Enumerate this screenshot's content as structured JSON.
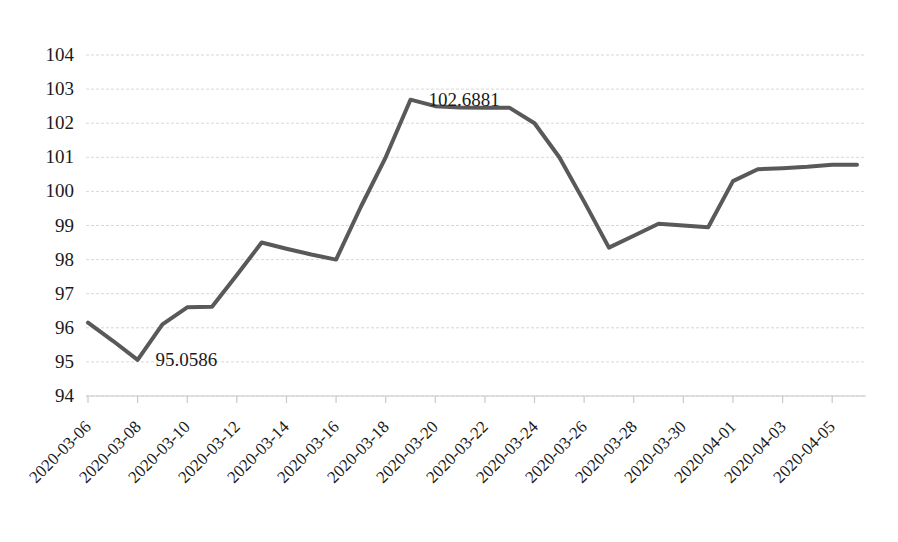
{
  "chart_data": {
    "type": "line",
    "title": "",
    "xlabel": "",
    "ylabel": "",
    "ylim": [
      94,
      104
    ],
    "ytick_step": 1,
    "grid": true,
    "grid_axis": "y",
    "legend": "none",
    "line_color": "#595959",
    "line_width": 4,
    "x": [
      "2020-03-06",
      "2020-03-07",
      "2020-03-08",
      "2020-03-09",
      "2020-03-10",
      "2020-03-11",
      "2020-03-12",
      "2020-03-13",
      "2020-03-14",
      "2020-03-15",
      "2020-03-16",
      "2020-03-17",
      "2020-03-18",
      "2020-03-19",
      "2020-03-20",
      "2020-03-21",
      "2020-03-22",
      "2020-03-23",
      "2020-03-24",
      "2020-03-25",
      "2020-03-26",
      "2020-03-27",
      "2020-03-28",
      "2020-03-29",
      "2020-03-30",
      "2020-03-31",
      "2020-04-01",
      "2020-04-02",
      "2020-04-03",
      "2020-04-04",
      "2020-04-05",
      "2020-04-06"
    ],
    "values": [
      96.15,
      95.62,
      95.06,
      96.1,
      96.6,
      96.62,
      97.55,
      98.5,
      98.32,
      98.15,
      98.0,
      99.55,
      101.0,
      102.69,
      102.5,
      102.46,
      102.45,
      102.45,
      102.0,
      101.0,
      99.7,
      98.35,
      98.7,
      99.05,
      99.0,
      98.95,
      100.3,
      100.65,
      100.68,
      100.72,
      100.78,
      100.78
    ],
    "ytick_labels": [
      "104",
      "103",
      "102",
      "101",
      "100",
      "99",
      "98",
      "97",
      "96",
      "95",
      "94"
    ],
    "xtick_labels": [
      "2020-03-06",
      "2020-03-08",
      "2020-03-10",
      "2020-03-12",
      "2020-03-14",
      "2020-03-16",
      "2020-03-18",
      "2020-03-20",
      "2020-03-22",
      "2020-03-24",
      "2020-03-26",
      "2020-03-28",
      "2020-03-30",
      "2020-04-01",
      "2020-04-03",
      "2020-04-05"
    ],
    "annotations": [
      {
        "label": "95.0586",
        "value": 95.0586,
        "x": "2020-03-08"
      },
      {
        "label": "102.6881",
        "value": 102.6881,
        "x": "2020-03-19"
      }
    ]
  }
}
